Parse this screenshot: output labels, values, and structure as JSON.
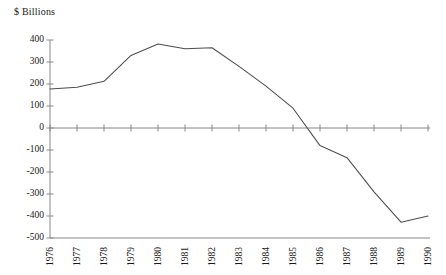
{
  "chart_data": {
    "type": "line",
    "title": "",
    "ylabel": "$ Billions",
    "xlabel": "",
    "ylim": [
      -500,
      400
    ],
    "ytick_step": 100,
    "yticks": [
      400,
      300,
      200,
      100,
      0,
      -100,
      -200,
      -300,
      -400,
      -500
    ],
    "ytick_labels": [
      "400",
      "300",
      "200",
      "100",
      "0",
      "-100",
      "-200",
      "-300",
      "-400",
      "-500"
    ],
    "categories": [
      "1976",
      "1977",
      "1978",
      "1979",
      "1980",
      "1981",
      "1982",
      "1983",
      "1984",
      "1985",
      "1986",
      "1987",
      "1988",
      "1989",
      "1990"
    ],
    "x": [
      1976,
      1977,
      1978,
      1979,
      1980,
      1981,
      1982,
      1983,
      1984,
      1985,
      1986,
      1987,
      1988,
      1989,
      1990
    ],
    "values": [
      177,
      185,
      212,
      330,
      382,
      360,
      365,
      280,
      190,
      90,
      -80,
      -135,
      -290,
      -428,
      -400
    ],
    "series": [
      {
        "name": "",
        "values": [
          177,
          185,
          212,
          330,
          382,
          360,
          365,
          280,
          190,
          90,
          -80,
          -135,
          -290,
          -428,
          -400
        ]
      }
    ],
    "grid": false,
    "legend": "none",
    "line_color": "#4d4d4d",
    "axis_color": "#888888",
    "zero_line": 0
  },
  "axes": {
    "y_axis_title": "$ Billions"
  }
}
